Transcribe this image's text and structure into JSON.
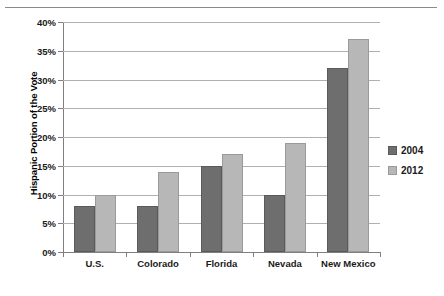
{
  "chart_data": {
    "type": "bar",
    "title": "",
    "xlabel": "",
    "ylabel": "Hispanic Portion of the Vote",
    "ylim": [
      0,
      40
    ],
    "ytick_labels": [
      "40%",
      "35%",
      "30%",
      "25%",
      "20%",
      "15%",
      "10%",
      "5%",
      "0%"
    ],
    "ytick_values": [
      40,
      35,
      30,
      25,
      20,
      15,
      10,
      5,
      0
    ],
    "grid": true,
    "legend_position": "right",
    "categories": [
      "U.S.",
      "Colorado",
      "Florida",
      "Nevada",
      "New Mexico"
    ],
    "series": [
      {
        "name": "2004",
        "color": "#6e6e6e",
        "values": [
          8,
          8,
          15,
          10,
          32
        ]
      },
      {
        "name": "2012",
        "color": "#b7b7b7",
        "values": [
          10,
          14,
          17,
          19,
          37
        ]
      }
    ]
  },
  "legend": {
    "items": [
      {
        "label": "2004"
      },
      {
        "label": "2012"
      }
    ]
  }
}
